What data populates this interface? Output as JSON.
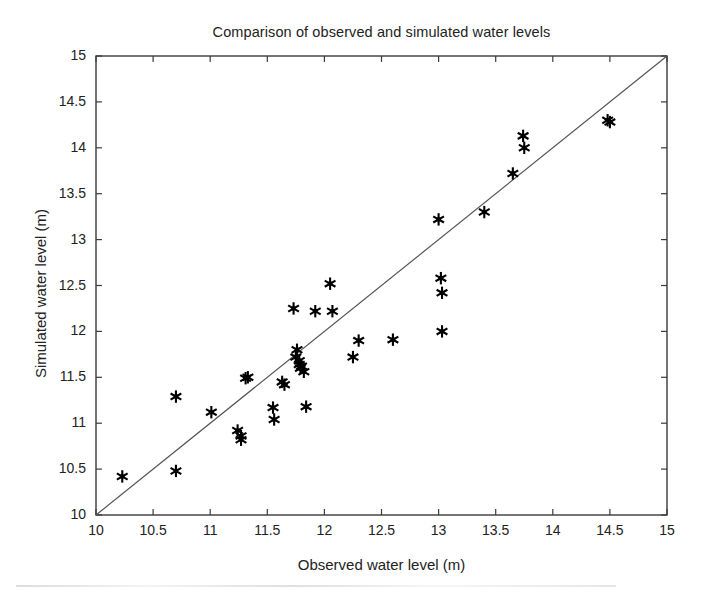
{
  "chart_data": {
    "type": "scatter",
    "title": "Comparison of observed and simulated water levels",
    "xlabel": "Observed water level (m)",
    "ylabel": "Simulated water level (m)",
    "xlim": [
      10,
      15
    ],
    "ylim": [
      10,
      15
    ],
    "xticks": [
      10,
      10.5,
      11,
      11.5,
      12,
      12.5,
      13,
      13.5,
      14,
      14.5,
      15
    ],
    "yticks": [
      10,
      10.5,
      11,
      11.5,
      12,
      12.5,
      13,
      13.5,
      14,
      14.5,
      15
    ],
    "xtick_labels": [
      "10",
      "10.5",
      "11",
      "11.5",
      "12",
      "12.5",
      "13",
      "13.5",
      "14",
      "14.5",
      "15"
    ],
    "ytick_labels": [
      "10",
      "10.5",
      "11",
      "11.5",
      "12",
      "12.5",
      "13",
      "13.5",
      "14",
      "14.5",
      "15"
    ],
    "grid": false,
    "legend": "none",
    "marker": "six-pointed-star",
    "marker_color": "#000000",
    "series": [
      {
        "name": "observed vs simulated",
        "points": [
          [
            10.23,
            10.42
          ],
          [
            10.7,
            10.48
          ],
          [
            10.7,
            11.29
          ],
          [
            11.01,
            11.12
          ],
          [
            11.24,
            10.92
          ],
          [
            11.27,
            10.86
          ],
          [
            11.27,
            10.82
          ],
          [
            11.31,
            11.49
          ],
          [
            11.33,
            11.5
          ],
          [
            11.55,
            11.17
          ],
          [
            11.56,
            11.04
          ],
          [
            11.63,
            11.45
          ],
          [
            11.65,
            11.42
          ],
          [
            11.73,
            12.25
          ],
          [
            11.75,
            11.72
          ],
          [
            11.76,
            11.8
          ],
          [
            11.78,
            11.68
          ],
          [
            11.78,
            11.64
          ],
          [
            11.79,
            11.6
          ],
          [
            11.8,
            11.62
          ],
          [
            11.82,
            11.56
          ],
          [
            11.84,
            11.18
          ],
          [
            11.92,
            12.22
          ],
          [
            12.05,
            12.52
          ],
          [
            12.07,
            12.22
          ],
          [
            12.25,
            11.72
          ],
          [
            12.3,
            11.9
          ],
          [
            12.6,
            11.91
          ],
          [
            13.0,
            13.22
          ],
          [
            13.02,
            12.58
          ],
          [
            13.03,
            12.42
          ],
          [
            13.03,
            12.0
          ],
          [
            13.4,
            13.3
          ],
          [
            13.65,
            13.72
          ],
          [
            13.74,
            14.13
          ],
          [
            13.75,
            14.0
          ],
          [
            14.48,
            14.3
          ],
          [
            14.5,
            14.28
          ]
        ]
      }
    ],
    "reference_line": {
      "name": "1:1 line",
      "from": [
        10,
        10
      ],
      "to": [
        15,
        15
      ],
      "color": "#555555"
    }
  }
}
